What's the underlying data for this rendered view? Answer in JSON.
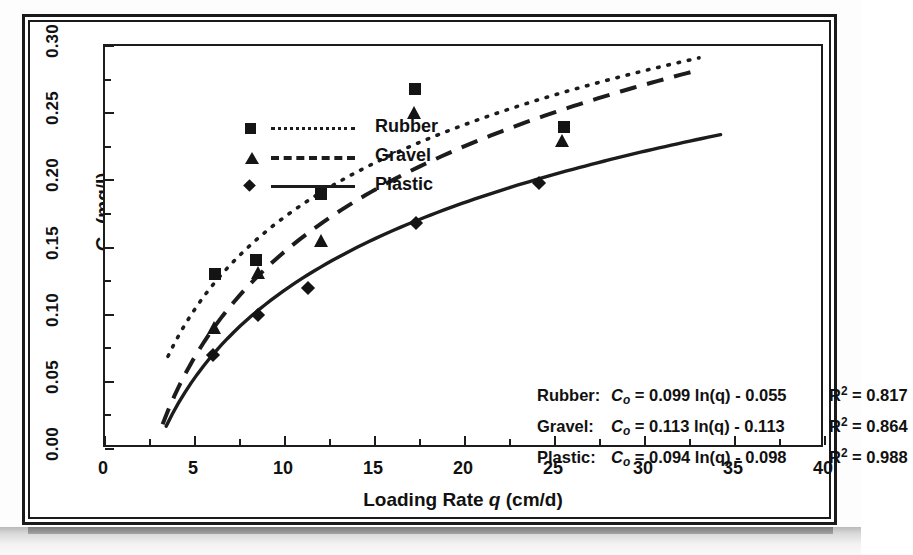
{
  "figure": {
    "border_color": "#1a1a1a",
    "background": "#ffffff"
  },
  "chart_data": {
    "type": "scatter",
    "title": "",
    "xlabel": "Loading Rate q (cm/d)",
    "ylabel": "C_o (mg/l)",
    "xlim": [
      0,
      40
    ],
    "ylim": [
      0.0,
      0.3
    ],
    "xticks": [
      "0",
      "5",
      "10",
      "15",
      "20",
      "25",
      "30",
      "35",
      "40"
    ],
    "yticks": [
      "0.00",
      "0.05",
      "0.10",
      "0.15",
      "0.20",
      "0.25",
      "0.30"
    ],
    "xtick_step": 5,
    "ytick_step": 0.05,
    "minor_ticks": true,
    "grid": false,
    "legend_position": "upper-left",
    "series": [
      {
        "name": "Rubber",
        "marker": "square",
        "line_style": "dotted",
        "color": "#151515",
        "points": [
          {
            "x": 6.1,
            "y": 0.13
          },
          {
            "x": 8.4,
            "y": 0.141
          },
          {
            "x": 12.0,
            "y": 0.19
          },
          {
            "x": 17.2,
            "y": 0.268
          },
          {
            "x": 25.5,
            "y": 0.24
          }
        ],
        "fit": {
          "equation": "C_o = 0.099 ln(q) - 0.055",
          "slope": 0.099,
          "intercept": -0.055,
          "r2": 0.817,
          "x_start": 3.5,
          "x_end": 33.0
        }
      },
      {
        "name": "Gravel",
        "marker": "triangle",
        "line_style": "dashed",
        "color": "#151515",
        "points": [
          {
            "x": 6.1,
            "y": 0.09
          },
          {
            "x": 8.5,
            "y": 0.131
          },
          {
            "x": 12.0,
            "y": 0.155
          },
          {
            "x": 17.2,
            "y": 0.25
          },
          {
            "x": 25.4,
            "y": 0.229
          }
        ],
        "fit": {
          "equation": "C_o = 0.113 ln(q) - 0.113",
          "slope": 0.113,
          "intercept": -0.113,
          "r2": 0.864,
          "x_start": 3.2,
          "x_end": 33.0
        }
      },
      {
        "name": "Plastic",
        "marker": "diamond",
        "line_style": "solid",
        "color": "#151515",
        "points": [
          {
            "x": 6.0,
            "y": 0.07
          },
          {
            "x": 8.5,
            "y": 0.1
          },
          {
            "x": 11.3,
            "y": 0.12
          },
          {
            "x": 17.3,
            "y": 0.168
          },
          {
            "x": 24.1,
            "y": 0.198
          }
        ],
        "fit": {
          "equation": "C_o = 0.094 ln(q) - 0.098",
          "slope": 0.094,
          "intercept": -0.098,
          "r2": 0.988,
          "x_start": 3.4,
          "x_end": 34.2
        }
      }
    ]
  },
  "legend": {
    "items": [
      {
        "label": "Rubber",
        "marker": "square",
        "line_style": "dotted"
      },
      {
        "label": "Gravel",
        "marker": "triangle",
        "line_style": "dashed"
      },
      {
        "label": "Plastic",
        "marker": "diamond",
        "line_style": "solid"
      }
    ]
  },
  "equations": [
    {
      "name": "Rubber:",
      "lhs": "C",
      "sub": "o",
      "body": " = 0.099 ln(q) - 0.055",
      "r2_label": "R",
      "r2_exp": "2",
      "r2_value": " = 0.817"
    },
    {
      "name": "Gravel:",
      "lhs": "C",
      "sub": "o",
      "body": " = 0.113 ln(q) - 0.113",
      "r2_label": "R",
      "r2_exp": "2",
      "r2_value": " = 0.864"
    },
    {
      "name": "Plastic:",
      "lhs": "C",
      "sub": "o",
      "body": " = 0.094 ln(q) - 0.098",
      "r2_label": "R",
      "r2_exp": "2",
      "r2_value": " = 0.988"
    }
  ],
  "axis": {
    "x_title_parts": {
      "text1": "Loading Rate ",
      "italic": "q",
      "text2": " (cm/d)"
    },
    "y_title_parts": {
      "main": "C",
      "sub": "o",
      "units": " (mg/l)"
    }
  }
}
